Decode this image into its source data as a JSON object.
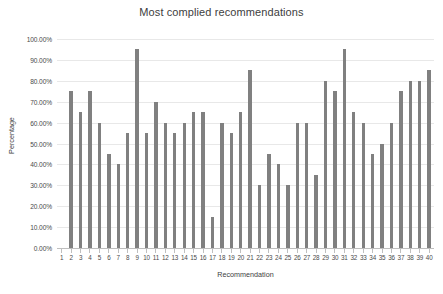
{
  "chart_data": {
    "type": "bar",
    "title": "Most complied recommendations",
    "xlabel": "Recommendation",
    "ylabel": "Percentage",
    "categories": [
      "1",
      "2",
      "3",
      "4",
      "5",
      "6",
      "7",
      "8",
      "9",
      "10",
      "11",
      "12",
      "13",
      "14",
      "15",
      "16",
      "17",
      "18",
      "19",
      "20",
      "21",
      "22",
      "23",
      "24",
      "25",
      "26",
      "27",
      "28",
      "29",
      "30",
      "31",
      "32",
      "33",
      "34",
      "35",
      "36",
      "37",
      "38",
      "39",
      "40"
    ],
    "values": [
      0,
      75,
      65,
      75,
      60,
      45,
      40,
      55,
      95,
      55,
      70,
      60,
      55,
      60,
      65,
      65,
      15,
      60,
      55,
      65,
      85,
      30,
      45,
      40,
      30,
      60,
      60,
      35,
      80,
      75,
      95,
      65,
      60,
      45,
      50,
      60,
      75,
      80,
      80,
      85
    ],
    "ytick_labels": [
      "100.00%",
      "90.00%",
      "80.00%",
      "70.00%",
      "60.00%",
      "50.00%",
      "40.00%",
      "30.00%",
      "20.00%",
      "10.00%",
      "0.00%"
    ],
    "ytick_values": [
      100,
      90,
      80,
      70,
      60,
      50,
      40,
      30,
      20,
      10,
      0
    ],
    "ylim": [
      0,
      100
    ],
    "grid": true,
    "legend": "none",
    "bar_color": "#808080",
    "grid_color": "#e8e8e8",
    "axis_color": "#bfbfbf"
  }
}
